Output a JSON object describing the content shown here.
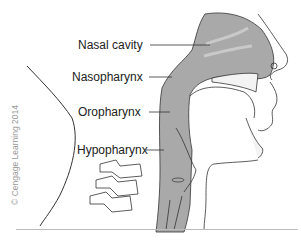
{
  "diagram": {
    "labels": [
      {
        "id": "nasal-cavity",
        "text": "Nasal cavity"
      },
      {
        "id": "nasopharynx",
        "text": "Nasopharynx"
      },
      {
        "id": "oropharynx",
        "text": "Oropharynx"
      },
      {
        "id": "hypopharynx",
        "text": "Hypopharynx"
      }
    ],
    "copyright": "© Cengage Learning 2014",
    "colors": {
      "airway_fill": "#a9a9a9",
      "outline": "#333333",
      "text": "#222222"
    }
  }
}
